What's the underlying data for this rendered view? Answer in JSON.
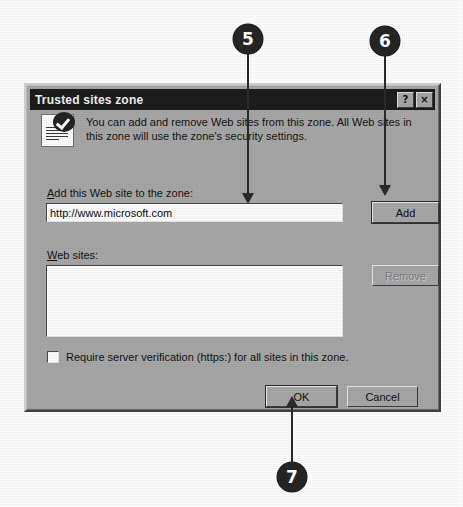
{
  "page": {
    "background": "#ffffff",
    "dialog_face_color": "#a8a8a8",
    "titlebar_color": "#1d1d1d",
    "callout_color": "#262626"
  },
  "dialog": {
    "title": "Trusted sites zone",
    "titlebar_buttons": [
      {
        "name": "help-button",
        "label": "?"
      },
      {
        "name": "close-button",
        "label": "×"
      }
    ],
    "icon_name": "trusted-sites-zone-icon",
    "description": "You can add and remove Web sites from this zone. All Web sites in this zone will use the zone's security settings.",
    "add_site": {
      "label_prefix": "A",
      "label_rest": "dd this Web site to the zone:",
      "input_value": "http://www.microsoft.com",
      "input_placeholder": ""
    },
    "web_sites": {
      "label_prefix": "W",
      "label_rest": "eb sites:",
      "items": []
    },
    "buttons": {
      "add": {
        "label": "Add",
        "enabled": true
      },
      "remove": {
        "label": "Remove",
        "enabled": false
      },
      "ok": {
        "label": "OK",
        "enabled": true,
        "is_default": true
      },
      "cancel": {
        "label": "Cancel",
        "enabled": true
      }
    },
    "checkbox": {
      "label": "Require server verification (https:) for all sites in this zone.",
      "checked": false
    }
  },
  "callouts": [
    {
      "number": "5",
      "target": "add-site-input"
    },
    {
      "number": "6",
      "target": "add-button"
    },
    {
      "number": "7",
      "target": "ok-button"
    }
  ]
}
